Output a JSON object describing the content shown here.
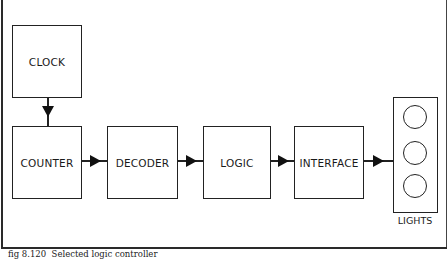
{
  "diagram": {
    "blocks": {
      "clock": "CLOCK",
      "counter": "COUNTER",
      "decoder": "DECODER",
      "logic": "LOGIC",
      "interface": "INTERFACE",
      "lights": "LIGHTS"
    },
    "lamp_count": 3,
    "connections": [
      {
        "from": "CLOCK",
        "to": "COUNTER"
      },
      {
        "from": "COUNTER",
        "to": "DECODER"
      },
      {
        "from": "DECODER",
        "to": "LOGIC"
      },
      {
        "from": "LOGIC",
        "to": "INTERFACE"
      },
      {
        "from": "INTERFACE",
        "to": "LIGHTS"
      }
    ]
  },
  "caption": {
    "figure_number": "fig 8.120",
    "text": "Selected logic controller"
  }
}
